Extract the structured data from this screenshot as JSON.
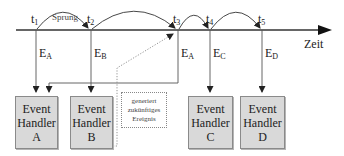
{
  "timeline": {
    "axis_label": "Zeit",
    "jump_label": "Sprung",
    "time_points": [
      {
        "id": "t1",
        "base": "t",
        "sub": "1"
      },
      {
        "id": "t2",
        "base": "t",
        "sub": "2"
      },
      {
        "id": "t3",
        "base": "t",
        "sub": "3"
      },
      {
        "id": "t4",
        "base": "t",
        "sub": "4"
      },
      {
        "id": "t5",
        "base": "t",
        "sub": "5"
      }
    ],
    "events": [
      {
        "at": "t1",
        "base": "E",
        "sub": "A"
      },
      {
        "at": "t2",
        "base": "E",
        "sub": "B"
      },
      {
        "at": "t3",
        "base": "E",
        "sub": "A"
      },
      {
        "at": "t4",
        "base": "E",
        "sub": "C"
      },
      {
        "at": "t5",
        "base": "E",
        "sub": "D"
      }
    ]
  },
  "handlers": [
    {
      "line1": "Event",
      "line2": "Handler",
      "line3": "A"
    },
    {
      "line1": "Event",
      "line2": "Handler",
      "line3": "B"
    },
    {
      "line1": "Event",
      "line2": "Handler",
      "line3": "C"
    },
    {
      "line1": "Event",
      "line2": "Handler",
      "line3": "D"
    }
  ],
  "note": {
    "line1": "generiert",
    "line2": "zukünftiges",
    "line3": "Ereignis"
  },
  "colors": {
    "line": "#333333",
    "box_fill": "#d9d9d9",
    "box_border": "#8a8a8a",
    "dotted": "#888888"
  }
}
